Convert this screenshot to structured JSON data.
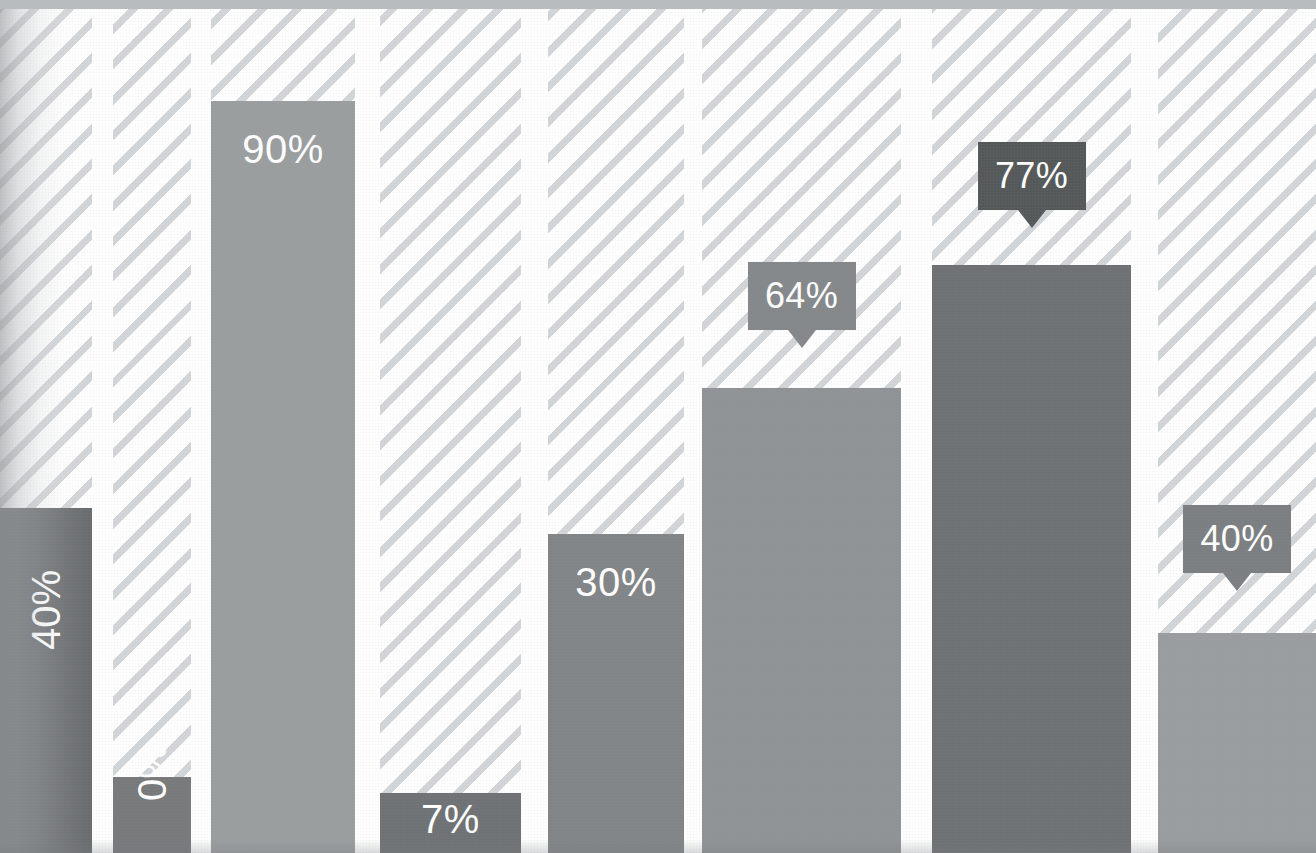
{
  "chart_data": {
    "type": "bar",
    "title": "",
    "subtitle": "",
    "xlabel": "",
    "ylabel": "",
    "ylim": [
      0,
      100
    ],
    "grid": false,
    "legend": "none",
    "value_suffix": "%",
    "categories": [
      "1",
      "2",
      "3",
      "4",
      "5",
      "6",
      "7",
      "8"
    ],
    "values": [
      40,
      0,
      90,
      7,
      30,
      64,
      77,
      40
    ],
    "labels": [
      "40%",
      "0%",
      "90%",
      "7%",
      "30%",
      "64%",
      "77%",
      "40%"
    ],
    "series": [
      {
        "name": "Percentage",
        "values": [
          40,
          0,
          90,
          7,
          30,
          64,
          77,
          40
        ]
      }
    ]
  },
  "style": {
    "background": "#ffffff",
    "track_stripe_color": "#d3d6d8",
    "track_base_color": "#fefefe",
    "top_band_color": "#b9bcbe",
    "label_text_color": "#ffffff",
    "bar_dark": "#6b6e70",
    "bar_mid": "#8b8e90",
    "bar_light": "#9a9d9f"
  },
  "bars": [
    {
      "id": "bar-1",
      "label": "40%",
      "value": 40,
      "color": "#6a6d6f",
      "label_mode": "rotated-inside",
      "label_position": "top",
      "left": 0,
      "width": 92,
      "top": 508,
      "clipped_left": true
    },
    {
      "id": "bar-2",
      "label": "0%",
      "value": 0,
      "color": "#77797b",
      "label_mode": "rotated-inside",
      "label_position": "bottom",
      "left": 113,
      "width": 78,
      "top": 777,
      "clipped_left": false
    },
    {
      "id": "bar-3",
      "label": "90%",
      "value": 90,
      "color": "#9b9e9f",
      "label_mode": "inside",
      "label_position": "top",
      "left": 211,
      "width": 144,
      "top": 101,
      "clipped_left": false
    },
    {
      "id": "bar-4",
      "label": "7%",
      "value": 7,
      "color": "#6f7274",
      "label_mode": "inside",
      "label_position": "bottom",
      "left": 380,
      "width": 141,
      "top": 793,
      "clipped_left": false
    },
    {
      "id": "bar-5",
      "label": "30%",
      "value": 30,
      "color": "#828587",
      "label_mode": "inside",
      "label_position": "top",
      "left": 548,
      "width": 136,
      "top": 534,
      "clipped_left": false
    },
    {
      "id": "bar-6",
      "label": "64%",
      "value": 64,
      "color": "#909395",
      "label_mode": "callout",
      "label_position": "above",
      "callout_color": "#85888a",
      "left": 702,
      "width": 199,
      "top": 388,
      "callout_top": 262,
      "clipped_left": false
    },
    {
      "id": "bar-7",
      "label": "77%",
      "value": 77,
      "color": "#6e7173",
      "label_mode": "callout",
      "label_position": "above",
      "callout_color": "#555859",
      "left": 932,
      "width": 199,
      "top": 265,
      "callout_top": 142,
      "clipped_left": false
    },
    {
      "id": "bar-8",
      "label": "40%",
      "value": 40,
      "color": "#9a9d9f",
      "label_mode": "callout",
      "label_position": "above",
      "callout_color": "#7c7f81",
      "left": 1158,
      "width": 158,
      "top": 633,
      "callout_top": 505,
      "clipped_left": false
    }
  ],
  "tracks": [
    {
      "id": "track-1",
      "left": 0,
      "width": 92
    },
    {
      "id": "track-2",
      "left": 113,
      "width": 78
    },
    {
      "id": "track-3",
      "left": 211,
      "width": 144
    },
    {
      "id": "track-4",
      "left": 380,
      "width": 141
    },
    {
      "id": "track-5",
      "left": 548,
      "width": 136
    },
    {
      "id": "track-6",
      "left": 702,
      "width": 199
    },
    {
      "id": "track-7",
      "left": 932,
      "width": 199
    },
    {
      "id": "track-8",
      "left": 1158,
      "width": 158
    }
  ]
}
